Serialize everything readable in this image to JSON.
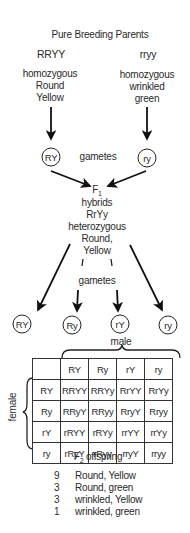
{
  "title": "Pure Breeding Parents",
  "parents": [
    {
      "genotype": "RRYY",
      "description": [
        "homozygous",
        "Round",
        "Yellow"
      ],
      "gamete": "RY"
    },
    {
      "genotype": "rryy",
      "description": [
        "homozygous",
        "wrinkled",
        "green"
      ],
      "gamete": "ry"
    }
  ],
  "gametes_label": "gametes",
  "f1": {
    "label": "F",
    "label_sub": "1",
    "lines": [
      "hybrids",
      "RrYy",
      "heterozygous",
      "Round,",
      "Yellow"
    ]
  },
  "f1_gametes": [
    "RY",
    "Ry",
    "rY",
    "ry"
  ],
  "male_label": "male",
  "female_label": "female",
  "punnett": {
    "columns": [
      "RY",
      "Ry",
      "rY",
      "ry"
    ],
    "rows": [
      {
        "header": "RY",
        "cells": [
          "RRYY",
          "RRYy",
          "RrYY",
          "RrYy"
        ]
      },
      {
        "header": "Ry",
        "cells": [
          "RRyY",
          "RRyy",
          "RryY",
          "Rryy"
        ]
      },
      {
        "header": "rY",
        "cells": [
          "rRYY",
          "rRYy",
          "rrYY",
          "rrYy"
        ]
      },
      {
        "header": "ry",
        "cells": [
          "rRyY",
          "rRyy",
          "rryY",
          "rryy"
        ]
      }
    ]
  },
  "f2": {
    "label": "F",
    "label_sub": "2",
    "label_suffix": " offspring",
    "ratios": [
      {
        "count": "9",
        "phenotype": "Round, Yellow"
      },
      {
        "count": "3",
        "phenotype": "Round, green"
      },
      {
        "count": "3",
        "phenotype": "wrinkled, Yellow"
      },
      {
        "count": "1",
        "phenotype": "wrinkled, green"
      }
    ]
  }
}
